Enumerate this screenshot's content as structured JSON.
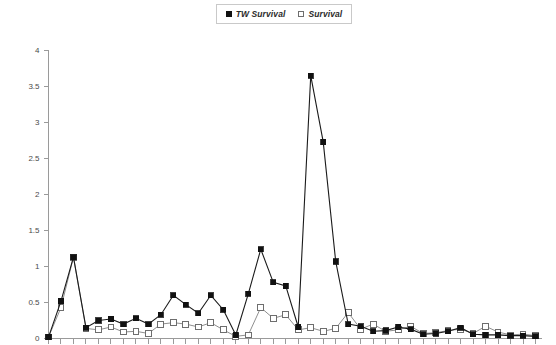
{
  "legend": {
    "position": "top-center",
    "entries": [
      {
        "label": "TW Survival",
        "marker": "filled-square",
        "color": "#111111"
      },
      {
        "label": "Survival",
        "marker": "hollow-square",
        "color": "#6e6e6e"
      }
    ]
  },
  "axes": {
    "y_ticks": [
      "0",
      "0.5",
      "1",
      "1.5",
      "2",
      "2.5",
      "3",
      "3.5",
      "4"
    ],
    "y_tick_values": [
      0,
      0.5,
      1,
      1.5,
      2,
      2.5,
      3,
      3.5,
      4
    ],
    "x_tick_count": 40,
    "x_labels_visible": false
  },
  "chart_data": {
    "type": "line",
    "title": "",
    "xlabel": "",
    "ylabel": "",
    "ylim": [
      0,
      4
    ],
    "grid": false,
    "legend_position": "top-center",
    "x": [
      1,
      2,
      3,
      4,
      5,
      6,
      7,
      8,
      9,
      10,
      11,
      12,
      13,
      14,
      15,
      16,
      17,
      18,
      19,
      20,
      21,
      22,
      23,
      24,
      25,
      26,
      27,
      28,
      29,
      30,
      31,
      32,
      33,
      34,
      35,
      36,
      37,
      38,
      39,
      40
    ],
    "series": [
      {
        "name": "TW Survival",
        "marker": "filled-square",
        "color": "#111111",
        "values": [
          0.02,
          0.52,
          1.13,
          0.15,
          0.25,
          0.27,
          0.2,
          0.28,
          0.2,
          0.33,
          0.6,
          0.47,
          0.35,
          0.6,
          0.4,
          0.05,
          0.62,
          1.24,
          0.78,
          0.73,
          0.16,
          3.65,
          2.73,
          1.07,
          0.2,
          0.17,
          0.1,
          0.11,
          0.16,
          0.13,
          0.06,
          0.07,
          0.1,
          0.15,
          0.06,
          0.05,
          0.05,
          0.04,
          0.04,
          0.03
        ]
      },
      {
        "name": "Survival",
        "marker": "hollow-square",
        "color": "#6e6e6e",
        "values": [
          0.02,
          0.43,
          1.13,
          0.14,
          0.12,
          0.16,
          0.09,
          0.1,
          0.07,
          0.2,
          0.22,
          0.2,
          0.16,
          0.22,
          0.12,
          0.03,
          0.05,
          0.43,
          0.28,
          0.33,
          0.12,
          0.15,
          0.1,
          0.14,
          0.36,
          0.13,
          0.2,
          0.1,
          0.12,
          0.17,
          0.07,
          0.08,
          0.11,
          0.13,
          0.07,
          0.17,
          0.09,
          0.05,
          0.06,
          0.04
        ]
      }
    ]
  }
}
